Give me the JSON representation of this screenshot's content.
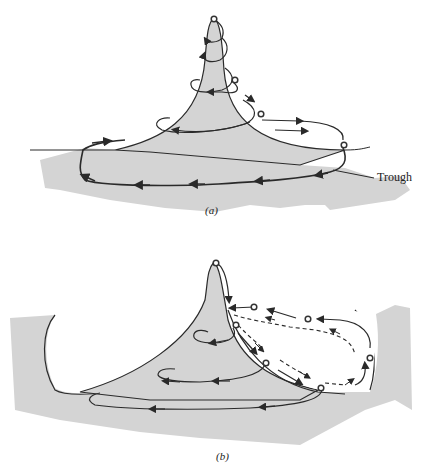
{
  "figure": {
    "panels": [
      {
        "id": "a",
        "label": "(a)"
      },
      {
        "id": "b",
        "label": "(b)"
      }
    ],
    "annotations": {
      "trough": "Trough"
    },
    "colors": {
      "fill": "#d4d4d4",
      "line": "#2a2a2a",
      "background": "#ffffff",
      "marker": "#444444"
    },
    "elements": {
      "panel_a": {
        "shape": "peak-with-trough-base",
        "markers": 5,
        "trajectory": "spiral loops descending from peak, large loop around trough"
      },
      "panel_b": {
        "shape": "peak-with-raised-rims",
        "markers": 7,
        "trajectory": "spiral loops on left, solid and dashed paths loop through right basin"
      }
    }
  }
}
